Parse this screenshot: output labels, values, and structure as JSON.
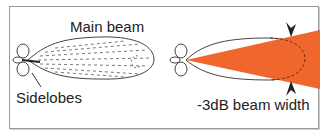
{
  "diagram": {
    "left_panel": {
      "main_beam_label": "Main beam",
      "sidelobes_label": "Sidelobes"
    },
    "right_panel": {
      "beam_width_label": "-3dB beam width"
    },
    "colors": {
      "beam_fill": "#f0672e",
      "outline": "#333333",
      "border": "#9a9a9a"
    },
    "icons": [
      "sidelobe-petals",
      "main-lobe-hatched",
      "beam-width-arrow-top",
      "beam-width-arrow-bottom"
    ]
  }
}
